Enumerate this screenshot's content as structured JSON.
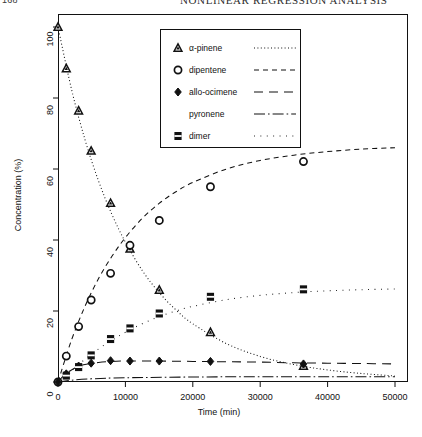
{
  "page": {
    "folio": "168",
    "running_head": "NONLINEAR REGRESSION ANALYSIS"
  },
  "chart_data": {
    "type": "scatter",
    "title": "",
    "xlabel": "Time (min)",
    "ylabel": "Concentration (%)",
    "xlim": [
      -2500,
      52000
    ],
    "ylim": [
      -4,
      104
    ],
    "xticks": [
      0,
      10000,
      20000,
      30000,
      40000,
      50000
    ],
    "yticks": [
      0,
      20,
      40,
      60,
      80,
      100
    ],
    "grid": false,
    "legend_position": "upper-center",
    "series": [
      {
        "name": "α-pinene",
        "marker": "triangle",
        "linestyle": "dotted",
        "color": "#111111",
        "points": [
          {
            "x": 0,
            "y": 100.0
          },
          {
            "x": 1230,
            "y": 88.3
          },
          {
            "x": 3060,
            "y": 76.4
          },
          {
            "x": 4920,
            "y": 65.1
          },
          {
            "x": 7800,
            "y": 50.4
          },
          {
            "x": 10680,
            "y": 37.5
          },
          {
            "x": 15030,
            "y": 25.9
          },
          {
            "x": 22620,
            "y": 14.0
          },
          {
            "x": 36420,
            "y": 4.5
          }
        ],
        "fit": [
          {
            "x": 0,
            "y": 100.0
          },
          {
            "x": 2000,
            "y": 82.5
          },
          {
            "x": 4000,
            "y": 68.3
          },
          {
            "x": 6000,
            "y": 56.7
          },
          {
            "x": 8000,
            "y": 47.2
          },
          {
            "x": 10000,
            "y": 39.4
          },
          {
            "x": 12500,
            "y": 31.4
          },
          {
            "x": 15000,
            "y": 25.2
          },
          {
            "x": 17500,
            "y": 20.3
          },
          {
            "x": 20000,
            "y": 16.4
          },
          {
            "x": 25000,
            "y": 10.8
          },
          {
            "x": 30000,
            "y": 7.2
          },
          {
            "x": 35000,
            "y": 4.9
          },
          {
            "x": 40000,
            "y": 3.4
          },
          {
            "x": 45000,
            "y": 2.4
          },
          {
            "x": 50000,
            "y": 1.7
          }
        ]
      },
      {
        "name": "dipentene",
        "marker": "circle",
        "linestyle": "dashed",
        "color": "#111111",
        "points": [
          {
            "x": 0,
            "y": 0.0
          },
          {
            "x": 1230,
            "y": 7.3
          },
          {
            "x": 3060,
            "y": 15.6
          },
          {
            "x": 4920,
            "y": 23.1
          },
          {
            "x": 7800,
            "y": 30.6
          },
          {
            "x": 10680,
            "y": 38.5
          },
          {
            "x": 15030,
            "y": 45.5
          },
          {
            "x": 22620,
            "y": 55.0
          },
          {
            "x": 36420,
            "y": 62.1
          }
        ],
        "fit": [
          {
            "x": 0,
            "y": 0.0
          },
          {
            "x": 2000,
            "y": 11.8
          },
          {
            "x": 4000,
            "y": 21.3
          },
          {
            "x": 6000,
            "y": 29.1
          },
          {
            "x": 8000,
            "y": 35.4
          },
          {
            "x": 10000,
            "y": 40.7
          },
          {
            "x": 12500,
            "y": 46.1
          },
          {
            "x": 15000,
            "y": 50.3
          },
          {
            "x": 17500,
            "y": 53.6
          },
          {
            "x": 20000,
            "y": 56.2
          },
          {
            "x": 25000,
            "y": 60.0
          },
          {
            "x": 30000,
            "y": 62.4
          },
          {
            "x": 35000,
            "y": 63.9
          },
          {
            "x": 40000,
            "y": 64.9
          },
          {
            "x": 45000,
            "y": 65.6
          },
          {
            "x": 50000,
            "y": 66.0
          }
        ]
      },
      {
        "name": "allo-ocimene",
        "marker": "diamond",
        "linestyle": "long-dashed",
        "color": "#111111",
        "points": [
          {
            "x": 0,
            "y": 0.0
          },
          {
            "x": 1230,
            "y": 2.3
          },
          {
            "x": 3060,
            "y": 4.5
          },
          {
            "x": 4920,
            "y": 5.3
          },
          {
            "x": 7800,
            "y": 6.0
          },
          {
            "x": 10680,
            "y": 5.9
          },
          {
            "x": 15030,
            "y": 5.9
          },
          {
            "x": 22620,
            "y": 5.8
          },
          {
            "x": 36420,
            "y": 5.1
          }
        ],
        "fit": [
          {
            "x": 0,
            "y": 0.0
          },
          {
            "x": 1000,
            "y": 2.1
          },
          {
            "x": 2000,
            "y": 3.4
          },
          {
            "x": 3000,
            "y": 4.3
          },
          {
            "x": 4000,
            "y": 4.9
          },
          {
            "x": 6000,
            "y": 5.5
          },
          {
            "x": 8000,
            "y": 5.8
          },
          {
            "x": 10000,
            "y": 5.9
          },
          {
            "x": 15000,
            "y": 5.9
          },
          {
            "x": 20000,
            "y": 5.8
          },
          {
            "x": 25000,
            "y": 5.7
          },
          {
            "x": 30000,
            "y": 5.6
          },
          {
            "x": 35000,
            "y": 5.4
          },
          {
            "x": 40000,
            "y": 5.3
          },
          {
            "x": 45000,
            "y": 5.2
          },
          {
            "x": 50000,
            "y": 5.1
          }
        ]
      },
      {
        "name": "pyronene",
        "marker": "none",
        "linestyle": "dash-dot",
        "color": "#111111",
        "points": [],
        "fit": [
          {
            "x": 0,
            "y": 0.0
          },
          {
            "x": 2000,
            "y": 0.5
          },
          {
            "x": 5000,
            "y": 0.9
          },
          {
            "x": 10000,
            "y": 1.2
          },
          {
            "x": 20000,
            "y": 1.4
          },
          {
            "x": 30000,
            "y": 1.5
          },
          {
            "x": 40000,
            "y": 1.5
          },
          {
            "x": 50000,
            "y": 1.5
          }
        ]
      },
      {
        "name": "dimer",
        "marker": "square-dotted",
        "linestyle": "fine-dotted",
        "color": "#111111",
        "points": [
          {
            "x": 1230,
            "y": 1.8
          },
          {
            "x": 3060,
            "y": 4.2
          },
          {
            "x": 4920,
            "y": 7.5
          },
          {
            "x": 7800,
            "y": 12.1
          },
          {
            "x": 10680,
            "y": 15.1
          },
          {
            "x": 15030,
            "y": 19.3
          },
          {
            "x": 22620,
            "y": 24.0
          },
          {
            "x": 36420,
            "y": 26.1
          }
        ],
        "fit": [
          {
            "x": 0,
            "y": 0.0
          },
          {
            "x": 2000,
            "y": 3.2
          },
          {
            "x": 4000,
            "y": 6.4
          },
          {
            "x": 6000,
            "y": 9.3
          },
          {
            "x": 8000,
            "y": 11.8
          },
          {
            "x": 10000,
            "y": 14.0
          },
          {
            "x": 12500,
            "y": 16.4
          },
          {
            "x": 15000,
            "y": 18.4
          },
          {
            "x": 17500,
            "y": 20.0
          },
          {
            "x": 20000,
            "y": 21.3
          },
          {
            "x": 25000,
            "y": 23.2
          },
          {
            "x": 30000,
            "y": 24.4
          },
          {
            "x": 35000,
            "y": 25.2
          },
          {
            "x": 40000,
            "y": 25.7
          },
          {
            "x": 45000,
            "y": 26.0
          },
          {
            "x": 50000,
            "y": 26.2
          }
        ]
      }
    ],
    "legend": [
      {
        "label": "α-pinene",
        "marker": "triangle",
        "linestyle": "dotted"
      },
      {
        "label": "dipentene",
        "marker": "circle",
        "linestyle": "dashed"
      },
      {
        "label": "allo-ocimene",
        "marker": "diamond",
        "linestyle": "long-dashed"
      },
      {
        "label": "pyronene",
        "marker": "none",
        "linestyle": "dash-dot"
      },
      {
        "label": "dimer",
        "marker": "square-dotted",
        "linestyle": "fine-dotted"
      }
    ]
  }
}
